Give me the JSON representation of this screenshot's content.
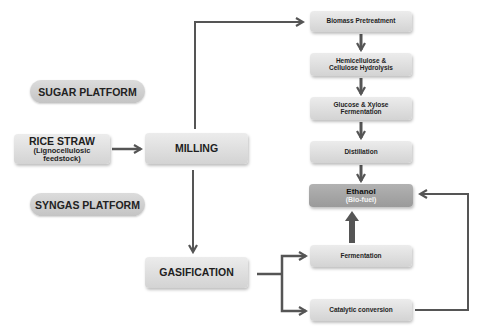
{
  "platforms": {
    "sugar": "SUGAR PLATFORM",
    "syngas": "SYNGAS PLATFORM"
  },
  "feedstock": {
    "title": "RICE STRAW",
    "subtitle_line1": "(Lignocellulosic",
    "subtitle_line2": "feedstock)"
  },
  "milling": "MILLING",
  "gasification": "GASIFICATION",
  "sugar_route": [
    {
      "line1": "Biomass Pretreatment"
    },
    {
      "line1": "Hemicellulose &",
      "line2": "Cellulose Hydrolysis"
    },
    {
      "line1": "Glucose & Xylose",
      "line2": "Fermentation"
    },
    {
      "line1": "Distillation"
    }
  ],
  "product": {
    "line1": "Ethanol",
    "line2": "(Bio-fuel)",
    "color": "#a6a6a6"
  },
  "syngas_route": [
    {
      "line1": "Fermentation"
    },
    {
      "line1": "Catalytic conversion"
    }
  ],
  "colors": {
    "box": "#dedede",
    "arrow": "#555555"
  }
}
